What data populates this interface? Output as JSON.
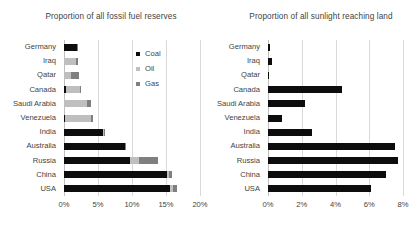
{
  "chart_data": [
    {
      "type": "bar",
      "id": "fossil-fuel-reserves",
      "title": "Proportion of all fossil fuel reserves",
      "orientation": "horizontal",
      "stacked": true,
      "xlabel": "",
      "ylabel": "",
      "xlim": [
        0,
        20
      ],
      "xunit": "%",
      "xticks": [
        "0%",
        "5%",
        "10%",
        "15%",
        "20%"
      ],
      "xtick_values": [
        0,
        5,
        10,
        15,
        20
      ],
      "grid": true,
      "legend_position": "inside-top-right",
      "categories": [
        "Germany",
        "Iraq",
        "Qatar",
        "Canada",
        "Saudi Arabia",
        "Venezuela",
        "India",
        "Australia",
        "Russia",
        "China",
        "USA"
      ],
      "series": [
        {
          "name": "Coal",
          "color": "#0d0d0d",
          "values": [
            1.9,
            0.0,
            0.0,
            0.25,
            0.0,
            0.1,
            5.8,
            8.9,
            9.7,
            15.1,
            15.6
          ]
        },
        {
          "name": "Oil",
          "color": "#bfbfbf",
          "values": [
            0.0,
            1.7,
            1.0,
            2.1,
            3.4,
            3.8,
            0.1,
            0.1,
            1.3,
            0.4,
            0.4
          ]
        },
        {
          "name": "Gas",
          "color": "#7f7f7f",
          "values": [
            0.1,
            0.4,
            1.2,
            0.2,
            0.6,
            0.4,
            0.1,
            0.1,
            2.8,
            0.4,
            0.6
          ]
        }
      ],
      "totals": [
        2.0,
        2.1,
        2.2,
        2.55,
        4.0,
        4.3,
        6.0,
        9.1,
        13.8,
        15.9,
        16.6
      ]
    },
    {
      "type": "bar",
      "id": "sunlight-reaching-land",
      "title": "Proportion of all sunlight reaching land",
      "orientation": "horizontal",
      "stacked": false,
      "xlabel": "",
      "ylabel": "",
      "xlim": [
        0,
        8
      ],
      "xunit": "%",
      "xticks": [
        "0%",
        "2%",
        "4%",
        "6%",
        "8%"
      ],
      "xtick_values": [
        0,
        2,
        4,
        6,
        8
      ],
      "grid": true,
      "categories": [
        "Germany",
        "Iraq",
        "Qatar",
        "Canada",
        "Saudi Arabia",
        "Venezuela",
        "India",
        "Australia",
        "Russia",
        "China",
        "USA"
      ],
      "series": [
        {
          "name": "Sunlight",
          "color": "#0d0d0d",
          "values": [
            0.12,
            0.26,
            0.03,
            4.4,
            2.2,
            0.8,
            2.6,
            7.5,
            7.7,
            7.0,
            6.1
          ]
        }
      ]
    }
  ],
  "left_chart": {
    "title": "Proportion of all fossil fuel reserves",
    "legend": [
      {
        "label": "Coal",
        "color": "#0d0d0d"
      },
      {
        "label": "Oil",
        "color": "#bfbfbf"
      },
      {
        "label": "Gas",
        "color": "#7f7f7f"
      }
    ]
  },
  "right_chart": {
    "title": "Proportion of all sunlight reaching land"
  }
}
